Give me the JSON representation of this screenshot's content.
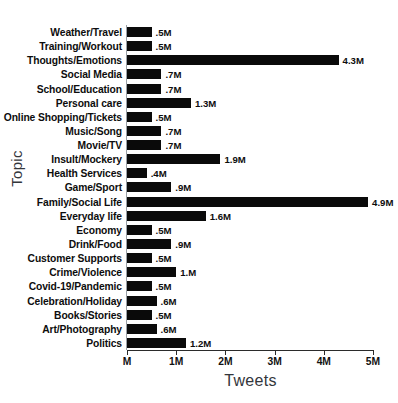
{
  "top_caption": "",
  "chart_data": {
    "type": "bar",
    "orientation": "horizontal",
    "title": "",
    "xlabel": "Tweets",
    "ylabel": "Topic",
    "xlim": [
      0,
      5
    ],
    "grid": false,
    "legend": null,
    "xtick_labels": [
      "M",
      "1M",
      "2M",
      "3M",
      "4M",
      "5M"
    ],
    "xtick_values": [
      0,
      1,
      2,
      3,
      4,
      5
    ],
    "categories": [
      "Weather/Travel",
      "Training/Workout",
      "Thoughts/Emotions",
      "Social Media",
      "School/Education",
      "Personal care",
      "Online Shopping/Tickets",
      "Music/Song",
      "Movie/TV",
      "Insult/Mockery",
      "Health Services",
      "Game/Sport",
      "Family/Social Life",
      "Everyday life",
      "Economy",
      "Drink/Food",
      "Customer Supports",
      "Crime/Violence",
      "Covid-19/Pandemic",
      "Celebration/Holiday",
      "Books/Stories",
      "Art/Photography",
      "Politics"
    ],
    "values": [
      0.5,
      0.5,
      4.3,
      0.7,
      0.7,
      1.3,
      0.5,
      0.7,
      0.7,
      1.9,
      0.4,
      0.9,
      4.9,
      1.6,
      0.5,
      0.9,
      0.5,
      1.0,
      0.5,
      0.6,
      0.5,
      0.6,
      1.2
    ],
    "value_labels": [
      ".5M",
      ".5M",
      "4.3M",
      ".7M",
      ".7M",
      "1.3M",
      ".5M",
      ".7M",
      ".7M",
      "1.9M",
      ".4M",
      ".9M",
      "4.9M",
      "1.6M",
      ".5M",
      ".9M",
      ".5M",
      "1.M",
      ".5M",
      ".6M",
      ".5M",
      ".6M",
      "1.2M"
    ],
    "bar_color": "#0a0a0a",
    "unit": "M"
  }
}
